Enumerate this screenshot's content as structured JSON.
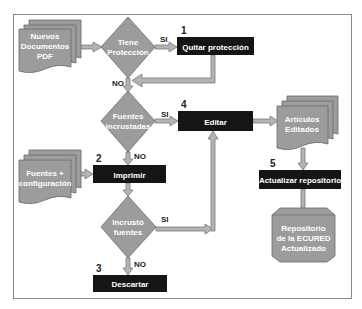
{
  "colors": {
    "background": "#ffffff",
    "frame_border": "#8a8a8a",
    "shape_fill": "#9c9c9c",
    "shape_stroke": "#6a6a6a",
    "process_fill": "#151515",
    "process_text": "#ffffff",
    "shape_text": "#ffffff",
    "arrow_fill": "#b4b4b4",
    "arrow_stroke": "#7a7a7a",
    "label_text": "#222222"
  },
  "inputs": {
    "nuevos_documentos": {
      "lines": [
        "Nuevos",
        "Documentos",
        "PDF"
      ]
    },
    "fuentes_config": {
      "lines": [
        "Fuentes +",
        "configuración"
      ]
    }
  },
  "decisions": {
    "tiene_proteccion": {
      "lines": [
        "Tiene",
        "Protección"
      ],
      "yes_label": "SI",
      "no_label": "NO"
    },
    "fuentes_incrustadas": {
      "lines": [
        "Fuentes",
        "incrustadas"
      ],
      "yes_label": "SI",
      "no_label": "NO"
    },
    "incrusto_fuentes": {
      "lines": [
        "Incrustó",
        "fuentes"
      ],
      "yes_label": "SI",
      "no_label": "NO"
    }
  },
  "processes": {
    "quitar_proteccion": {
      "step": "1",
      "label": "Quitar protección"
    },
    "imprimir": {
      "step": "2",
      "label": "Imprimir"
    },
    "descartar": {
      "step": "3",
      "label": "Descartar"
    },
    "editar": {
      "step": "4",
      "label": "Editar"
    },
    "actualizar_repositorio": {
      "step": "5",
      "label": "Actualizar repositorio"
    }
  },
  "outputs": {
    "articulos_editados": {
      "lines": [
        "Artículos",
        "Editados"
      ]
    },
    "repositorio": {
      "lines": [
        "Repositorio",
        "de la ECURED",
        "Actualizado"
      ]
    }
  }
}
